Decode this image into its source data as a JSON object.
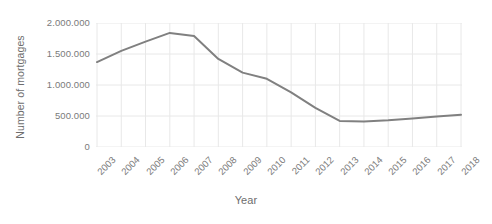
{
  "chart_data": {
    "type": "line",
    "title": "",
    "xlabel": "Year",
    "ylabel": "Number of mortgages",
    "categories": [
      "2003",
      "2004",
      "2005",
      "2006",
      "2007",
      "2008",
      "2009",
      "2010",
      "2011",
      "2012",
      "2013",
      "2014",
      "2015",
      "2016",
      "2017",
      "2018"
    ],
    "values": [
      1370000,
      1550000,
      1700000,
      1840000,
      1790000,
      1420000,
      1200000,
      1100000,
      880000,
      630000,
      420000,
      410000,
      430000,
      460000,
      490000,
      520000
    ],
    "series": [
      {
        "name": "Number of mortgages",
        "values": [
          1370000,
          1550000,
          1700000,
          1840000,
          1790000,
          1420000,
          1200000,
          1100000,
          880000,
          630000,
          420000,
          410000,
          430000,
          460000,
          490000,
          520000
        ]
      }
    ],
    "ylim": [
      0,
      2000000
    ],
    "ytick_labels": [
      "2.000.000",
      "1.500.000",
      "1.000.000",
      "500.000",
      "0"
    ],
    "ytick_values": [
      2000000,
      1500000,
      1000000,
      500000,
      0
    ],
    "grid": "vertical-and-horizontal",
    "legend_position": "none",
    "line_color": "#808080",
    "gridline_color": "#e8e8e8",
    "text_color": "#7a7a7a"
  }
}
